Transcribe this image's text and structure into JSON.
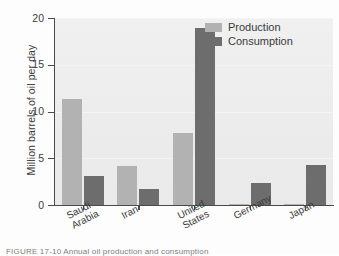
{
  "chart_data": {
    "type": "bar",
    "title": "",
    "xlabel": "",
    "ylabel": "Million barrels of oil per day",
    "ylim": [
      0,
      20
    ],
    "yticks": [
      0,
      5,
      10,
      15,
      20
    ],
    "ytick_labels": [
      "0",
      "5",
      "10",
      "15",
      "20"
    ],
    "grid": true,
    "legend_position": "top-right",
    "categories": [
      "Saudi Arabia",
      "Iran",
      "United States",
      "Germany",
      "Japan"
    ],
    "category_lines": [
      [
        "Saudi",
        "Arabia"
      ],
      [
        "Iran"
      ],
      [
        "United",
        "States"
      ],
      [
        "Germany"
      ],
      [
        "Japan"
      ]
    ],
    "series": [
      {
        "name": "Production",
        "color": "#b2b2b2",
        "values": [
          11.3,
          4.2,
          7.7,
          0.1,
          0.1
        ]
      },
      {
        "name": "Consumption",
        "color": "#6d6d6d",
        "values": [
          3.1,
          1.7,
          18.9,
          2.4,
          4.3
        ]
      }
    ]
  },
  "legend": {
    "items": [
      {
        "label": "Production",
        "color": "#b2b2b2"
      },
      {
        "label": "Consumption",
        "color": "#6d6d6d"
      }
    ]
  },
  "axes": {
    "y_title": "Million barrels of oil per day",
    "y_tick_labels": [
      "20",
      "15",
      "10",
      "5",
      "0"
    ]
  },
  "caption": {
    "text": "FIGURE 17-10  Annual oil production and consumption"
  },
  "colors": {
    "production": "#b2b2b2",
    "consumption": "#6d6d6d",
    "plot_background": "#eeeeee",
    "axis": "#4a4a4a",
    "text": "#3b3b3b"
  }
}
